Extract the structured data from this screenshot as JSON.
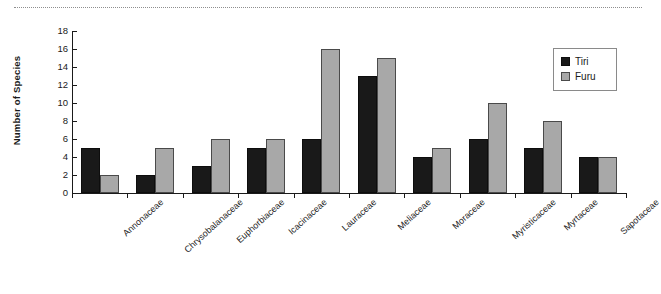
{
  "chart_data": {
    "type": "bar",
    "title": "",
    "subtitle": "",
    "xlabel": "",
    "ylabel": "Number of Species",
    "ylim": [
      0,
      18
    ],
    "ytick_step": 2,
    "yticks": [
      0,
      2,
      4,
      6,
      8,
      10,
      12,
      14,
      16,
      18
    ],
    "ytick_labels": [
      "0",
      "2",
      "4",
      "6",
      "8",
      "10",
      "12",
      "14",
      "16",
      "18"
    ],
    "grid": false,
    "legend_position": "top-right",
    "categories": [
      "Annonaceae",
      "Chrysobalanaceae",
      "Euphorbiaceae",
      "Icacinaceae",
      "Lauraceae",
      "Meliaceae",
      "Moraceae",
      "Myristicaceae",
      "Myrtaceae",
      "Sapotaceae"
    ],
    "series": [
      {
        "name": "Tiri",
        "color": "#191919",
        "values": [
          5,
          2,
          3,
          5,
          6,
          13,
          4,
          6,
          5,
          4
        ]
      },
      {
        "name": "Furu",
        "color": "#a8a8a8",
        "values": [
          2,
          5,
          6,
          6,
          16,
          15,
          5,
          10,
          8,
          4
        ]
      }
    ],
    "annotations": []
  },
  "legend": {
    "entries": [
      {
        "label": "Tiri",
        "swatch": "tiri"
      },
      {
        "label": "Furu",
        "swatch": "furu"
      }
    ]
  },
  "colors": {
    "tiri": "#191919",
    "furu": "#a8a8a8",
    "axis": "#1a1a1a",
    "background": "#ffffff"
  }
}
